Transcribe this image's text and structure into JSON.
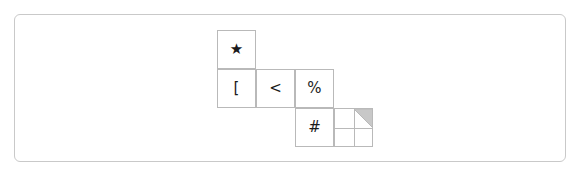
{
  "panel": {
    "border_color": "#c9c9c9",
    "background": "#ffffff"
  },
  "grid": {
    "cell_size": 39,
    "origin_x": 217,
    "origin_y": 30,
    "line_color": "#b9b9b9",
    "cells": [
      {
        "name": "cell-star",
        "row": 0,
        "col": 0,
        "glyph": "★",
        "glyph_name": "star-glyph"
      },
      {
        "name": "cell-bracket",
        "row": 1,
        "col": 0,
        "glyph": "[",
        "glyph_name": "left-square-bracket-glyph"
      },
      {
        "name": "cell-less",
        "row": 1,
        "col": 1,
        "glyph": "<",
        "glyph_name": "less-than-glyph"
      },
      {
        "name": "cell-percent",
        "row": 1,
        "col": 2,
        "glyph": "%",
        "glyph_name": "percent-glyph"
      },
      {
        "name": "cell-hash",
        "row": 2,
        "col": 2,
        "glyph": "#",
        "glyph_name": "number-sign-glyph"
      }
    ],
    "subdivided_cell": {
      "name": "cell-subdivided",
      "row": 2,
      "col": 3,
      "rows": 2,
      "cols": 2,
      "shaded_quadrant": "top-right",
      "shade_color": "#c8c8c8",
      "shade_shape": "triangle",
      "triangle_orientation": "upper-right"
    }
  }
}
